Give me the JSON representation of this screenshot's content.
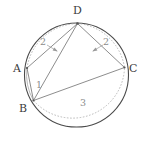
{
  "figure": {
    "background_color": "#ffffff",
    "circle_stroke": "#4a4a4a",
    "chord_stroke": "#808080",
    "dashed_arc_stroke": "#a8a8a8",
    "label_color": "#3c3c3c",
    "arc_label_color": "#8c8c8c",
    "circle": {
      "center_x": 76.5,
      "center_y": 75,
      "radius": 52
    }
  },
  "vertices": [
    {
      "id": "A",
      "label": "A",
      "x": 27.0,
      "y": 68.0,
      "label_x": 13.0,
      "label_y": 71.5
    },
    {
      "id": "B",
      "label": "B",
      "x": 33.5,
      "y": 100.5,
      "label_x": 19.0,
      "label_y": 112.0
    },
    {
      "id": "C",
      "label": "C",
      "x": 124.5,
      "y": 67.5,
      "label_x": 129.0,
      "label_y": 71.5
    },
    {
      "id": "D",
      "label": "D",
      "x": 77.5,
      "y": 23.5,
      "label_x": 73.0,
      "label_y": 14.0
    }
  ],
  "chords": [
    {
      "name": "segment-A-D",
      "from": "A",
      "to": "D"
    },
    {
      "name": "segment-B-D",
      "from": "B",
      "to": "D"
    },
    {
      "name": "segment-C-D",
      "from": "C",
      "to": "D"
    },
    {
      "name": "segment-A-B",
      "from": "A",
      "to": "B"
    },
    {
      "name": "segment-B-C",
      "from": "B",
      "to": "C"
    }
  ],
  "arc_labels": [
    {
      "name": "arc-label-AD",
      "text": "2",
      "x": 43.0,
      "y": 42.0,
      "arc": "A to D"
    },
    {
      "name": "arc-label-DC",
      "text": "2",
      "x": 105.0,
      "y": 42.0,
      "arc": "D to C"
    },
    {
      "name": "arc-label-AB",
      "text": "1",
      "x": 38.5,
      "y": 85.0,
      "arc": "A to B"
    },
    {
      "name": "arc-label-BC",
      "text": "3",
      "x": 83.0,
      "y": 103.0,
      "arc": "B to C"
    }
  ],
  "arc_values": {
    "AD": 2,
    "DC": 2,
    "AB": 1,
    "BC": 3
  }
}
